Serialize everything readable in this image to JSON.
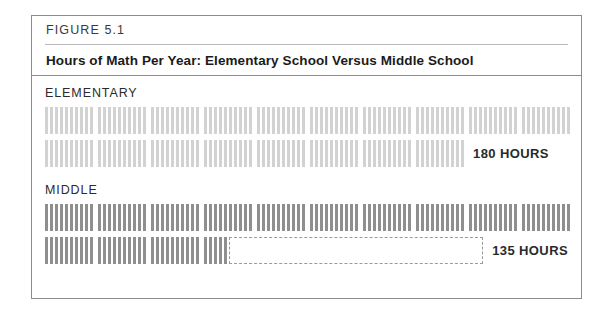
{
  "figure": {
    "label": "FIGURE 5.1",
    "title": "Hours of Math Per Year: Elementary School Versus Middle School"
  },
  "sections": [
    {
      "name": "elementary",
      "label": "ELEMENTARY",
      "total_label": "180 HOURS",
      "total_hours": 180,
      "tick_color": "#d2d2d2",
      "rows": [
        {
          "full_groups": 10,
          "partial_ticks": 0,
          "label": "",
          "remainder": false
        },
        {
          "full_groups": 8,
          "partial_ticks": 0,
          "label": "180 HOURS",
          "remainder": false
        }
      ]
    },
    {
      "name": "middle",
      "label": "MIDDLE",
      "total_label": "135 HOURS",
      "total_hours": 135,
      "tick_color": "#8f8f8f",
      "rows": [
        {
          "full_groups": 10,
          "partial_ticks": 0,
          "label": "",
          "remainder": false
        },
        {
          "full_groups": 3,
          "partial_ticks": 5,
          "label": "135 HOURS",
          "remainder": true
        }
      ]
    }
  ],
  "chart_data": {
    "type": "bar",
    "title": "Hours of Math Per Year: Elementary School Versus Middle School",
    "subtitle": "FIGURE 5.1",
    "categories": [
      "ELEMENTARY",
      "MIDDLE"
    ],
    "values": [
      180,
      135
    ],
    "value_labels": [
      "180 HOURS",
      "135 HOURS"
    ],
    "unit": "hours",
    "xlabel": "",
    "ylabel": "",
    "ticks_per_group": 10,
    "hours_per_tick": 1,
    "groups_per_row": 10,
    "row_capacity_hours": 100,
    "legend": [],
    "grid": false
  }
}
